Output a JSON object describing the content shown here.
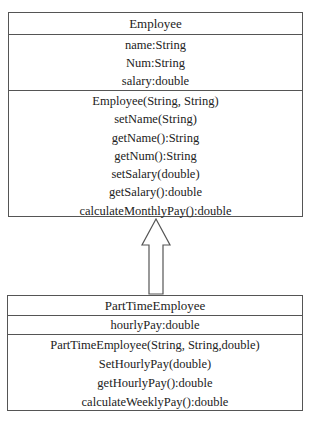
{
  "diagram": {
    "type": "uml-class-diagram",
    "relationship": {
      "kind": "inheritance",
      "from": "PartTimeEmployee",
      "to": "Employee",
      "arrow": "hollow-triangle"
    },
    "classes": {
      "employee": {
        "name": "Employee",
        "attributes": [
          "name:String",
          "Num:String",
          "salary:double"
        ],
        "methods": [
          "Employee(String, String)",
          "setName(String)",
          "getName():String",
          "getNum():String",
          "setSalary(double)",
          "getSalary():double",
          "calculateMonthlyPay():double"
        ]
      },
      "parttime": {
        "name": "PartTimeEmployee",
        "attributes": [
          "hourlyPay:double"
        ],
        "methods": [
          "PartTimeEmployee(String, String,double)",
          "SetHourlyPay(double)",
          "getHourlyPay():double",
          "calculateWeeklyPay():double"
        ]
      }
    },
    "colors": {
      "line": "#555555",
      "text": "#222222",
      "background": "#ffffff"
    }
  }
}
